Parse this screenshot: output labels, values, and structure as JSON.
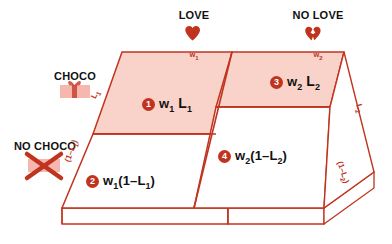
{
  "diagram": {
    "colors": {
      "stroke": "#c0341f",
      "fill": "#f9d3c9",
      "badge": "#c0341f",
      "text": "#111111",
      "icon_pink": "#f6b8ae"
    }
  },
  "columns": [
    {
      "id": "love",
      "label": "LOVE",
      "icon": "heart-icon",
      "weight_label": "w",
      "weight_sub": "1"
    },
    {
      "id": "no-love",
      "label": "NO LOVE",
      "icon": "broken-heart-icon",
      "weight_label": "w",
      "weight_sub": "2"
    }
  ],
  "rows": [
    {
      "id": "choco",
      "label": "CHOCO",
      "icon": "gift-box-icon"
    },
    {
      "id": "no-choco",
      "label": "NO CHOCO",
      "icon": "x-cross-icon"
    }
  ],
  "edge_labels": {
    "left_top": {
      "base": "L",
      "sub": "1"
    },
    "left_bottom": {
      "text": "(1–L",
      "sub": "1",
      "tail": ")"
    },
    "right_top": {
      "base": "L",
      "sub": "2"
    },
    "right_bottom": {
      "text": "(1–L",
      "sub": "2",
      "tail": ")"
    }
  },
  "cells": [
    {
      "number": "1",
      "region": "love-choco",
      "term_a": "w",
      "term_a_sub": "1",
      "term_b": "L",
      "term_b_sub": "1",
      "full_text": "w1 L1",
      "shaded": true
    },
    {
      "number": "2",
      "region": "love-no-choco",
      "term_a": "w",
      "term_a_sub": "1",
      "term_b": "(1–L",
      "term_b_sub": "1",
      "term_b_tail": ")",
      "full_text": "w1(1–L1)",
      "shaded": false
    },
    {
      "number": "3",
      "region": "no-love-choco",
      "term_a": "w",
      "term_a_sub": "2",
      "term_b": "L",
      "term_b_sub": "2",
      "full_text": "w2 L2",
      "shaded": true
    },
    {
      "number": "4",
      "region": "no-love-no-choco",
      "term_a": "w",
      "term_a_sub": "2",
      "term_b": "(1–L",
      "term_b_sub": "2",
      "term_b_tail": ")",
      "full_text": "w2(1–L2)",
      "shaded": false
    }
  ]
}
